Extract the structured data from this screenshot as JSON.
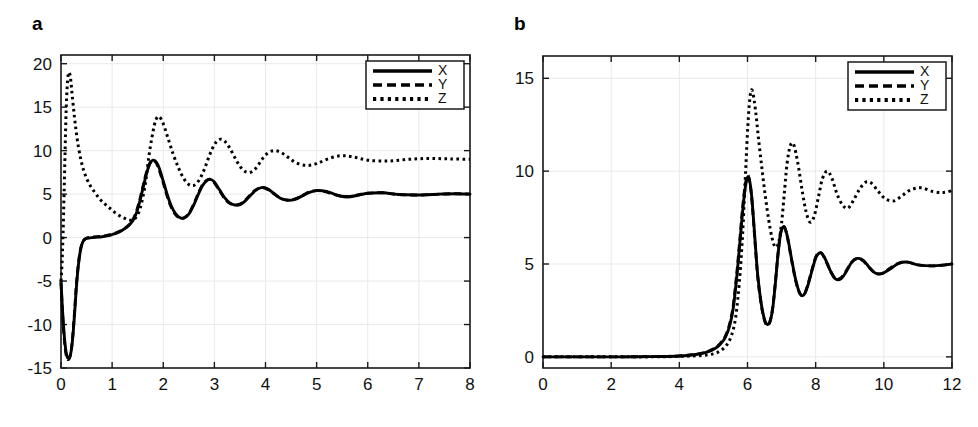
{
  "figure": {
    "background": "#ffffff",
    "ink_color": "#000000",
    "grid_color": "#e9e9e9"
  },
  "panels": [
    {
      "id": "a",
      "label": "a",
      "legend": {
        "position": "top-right",
        "entries": [
          {
            "name": "X",
            "style": "solid"
          },
          {
            "name": "Y",
            "style": "dashed"
          },
          {
            "name": "Z",
            "style": "dotted"
          }
        ]
      }
    },
    {
      "id": "b",
      "label": "b",
      "legend": {
        "position": "top-right",
        "entries": [
          {
            "name": "X",
            "style": "solid"
          },
          {
            "name": "Y",
            "style": "dashed"
          },
          {
            "name": "Z",
            "style": "dotted"
          }
        ]
      }
    }
  ],
  "chart_data": [
    {
      "type": "line",
      "panel": "a",
      "title": "a",
      "xlabel": "",
      "ylabel": "",
      "xlim": [
        0,
        8
      ],
      "ylim": [
        -15,
        21
      ],
      "xticks": [
        0,
        1,
        2,
        3,
        4,
        5,
        6,
        7,
        8
      ],
      "xticklabels": [
        "0",
        "1",
        "2",
        "3",
        "4",
        "5",
        "6",
        "7",
        "8"
      ],
      "yticks": [
        -15,
        -10,
        -5,
        0,
        5,
        10,
        15,
        20
      ],
      "yticklabels": [
        "-15",
        "-10",
        "-5",
        "0",
        "5",
        "10",
        "15",
        "20"
      ],
      "grid": true,
      "legend": [
        "X",
        "Y",
        "Z"
      ],
      "legend_position": "upper right",
      "series": [
        {
          "name": "X",
          "style": "solid",
          "x": [
            0.0,
            0.03,
            0.06,
            0.09,
            0.12,
            0.15,
            0.18,
            0.21,
            0.24,
            0.27,
            0.3,
            0.34,
            0.38,
            0.42,
            0.46,
            0.5,
            0.6,
            0.7,
            0.8,
            0.9,
            1.0,
            1.1,
            1.2,
            1.3,
            1.4,
            1.48,
            1.56,
            1.62,
            1.68,
            1.74,
            1.8,
            1.86,
            1.92,
            2.0,
            2.08,
            2.16,
            2.24,
            2.32,
            2.4,
            2.5,
            2.6,
            2.68,
            2.76,
            2.84,
            2.92,
            3.0,
            3.1,
            3.2,
            3.3,
            3.4,
            3.5,
            3.6,
            3.7,
            3.8,
            3.92,
            4.04,
            4.16,
            4.3,
            4.44,
            4.58,
            4.72,
            4.86,
            5.0,
            5.16,
            5.32,
            5.48,
            5.64,
            5.8,
            6.0,
            6.3,
            6.6,
            7.0,
            7.4,
            7.7,
            8.0
          ],
          "y": [
            -5.0,
            -8.4,
            -11.0,
            -12.8,
            -13.7,
            -13.9,
            -13.6,
            -12.6,
            -10.8,
            -8.4,
            -5.8,
            -3.2,
            -1.5,
            -0.6,
            -0.25,
            -0.1,
            0.0,
            0.05,
            0.1,
            0.2,
            0.35,
            0.55,
            0.85,
            1.25,
            1.9,
            2.9,
            4.6,
            6.1,
            7.5,
            8.5,
            8.9,
            8.7,
            8.0,
            6.5,
            4.9,
            3.6,
            2.75,
            2.3,
            2.25,
            2.7,
            3.8,
            4.9,
            5.9,
            6.5,
            6.7,
            6.4,
            5.5,
            4.6,
            4.0,
            3.75,
            3.8,
            4.2,
            4.8,
            5.4,
            5.75,
            5.6,
            5.1,
            4.5,
            4.3,
            4.4,
            4.8,
            5.2,
            5.4,
            5.35,
            5.05,
            4.75,
            4.7,
            4.85,
            5.1,
            5.15,
            4.95,
            4.9,
            5.0,
            5.05,
            5.0
          ]
        },
        {
          "name": "Y",
          "style": "dashed",
          "x": [
            0.0,
            0.03,
            0.06,
            0.09,
            0.12,
            0.15,
            0.18,
            0.21,
            0.24,
            0.27,
            0.3,
            0.34,
            0.38,
            0.42,
            0.46,
            0.5,
            0.6,
            0.7,
            0.8,
            0.9,
            1.0,
            1.1,
            1.2,
            1.3,
            1.4,
            1.48,
            1.56,
            1.62,
            1.68,
            1.74,
            1.8,
            1.86,
            1.92,
            2.0,
            2.08,
            2.16,
            2.24,
            2.32,
            2.4,
            2.5,
            2.6,
            2.68,
            2.76,
            2.84,
            2.92,
            3.0,
            3.1,
            3.2,
            3.3,
            3.4,
            3.5,
            3.6,
            3.7,
            3.8,
            3.92,
            4.04,
            4.16,
            4.3,
            4.44,
            4.58,
            4.72,
            4.86,
            5.0,
            5.16,
            5.32,
            5.48,
            5.64,
            5.8,
            6.0,
            6.3,
            6.6,
            7.0,
            7.4,
            7.7,
            8.0
          ],
          "y": [
            -5.2,
            -8.7,
            -11.4,
            -13.1,
            -13.9,
            -14.0,
            -13.6,
            -12.5,
            -10.6,
            -8.1,
            -5.5,
            -3.0,
            -1.4,
            -0.55,
            -0.2,
            -0.05,
            0.05,
            0.1,
            0.15,
            0.25,
            0.4,
            0.6,
            0.9,
            1.3,
            2.0,
            3.1,
            4.8,
            6.3,
            7.7,
            8.6,
            8.85,
            8.6,
            7.8,
            6.3,
            4.7,
            3.45,
            2.65,
            2.25,
            2.25,
            2.75,
            3.9,
            5.0,
            6.0,
            6.55,
            6.7,
            6.3,
            5.4,
            4.5,
            3.95,
            3.75,
            3.85,
            4.3,
            4.9,
            5.45,
            5.75,
            5.55,
            5.05,
            4.5,
            4.3,
            4.45,
            4.85,
            5.25,
            5.4,
            5.3,
            5.0,
            4.75,
            4.7,
            4.9,
            5.1,
            5.15,
            4.95,
            4.9,
            5.0,
            5.05,
            5.0
          ]
        },
        {
          "name": "Z",
          "style": "dotted",
          "x": [
            0.0,
            0.02,
            0.04,
            0.06,
            0.08,
            0.1,
            0.12,
            0.14,
            0.16,
            0.18,
            0.2,
            0.22,
            0.25,
            0.28,
            0.32,
            0.38,
            0.45,
            0.55,
            0.65,
            0.75,
            0.85,
            0.95,
            1.05,
            1.15,
            1.25,
            1.35,
            1.45,
            1.55,
            1.65,
            1.72,
            1.8,
            1.86,
            1.92,
            2.0,
            2.1,
            2.2,
            2.3,
            2.4,
            2.5,
            2.6,
            2.7,
            2.8,
            2.9,
            3.0,
            3.1,
            3.2,
            3.3,
            3.4,
            3.5,
            3.6,
            3.7,
            3.8,
            3.9,
            4.0,
            4.15,
            4.3,
            4.45,
            4.6,
            4.8,
            5.0,
            5.2,
            5.45,
            5.7,
            6.0,
            6.4,
            6.8,
            7.2,
            7.6,
            8.0
          ],
          "y": [
            -5.0,
            -3.0,
            0.5,
            5.0,
            10.0,
            14.5,
            17.3,
            18.7,
            19.0,
            18.6,
            17.6,
            16.3,
            14.6,
            13.0,
            11.2,
            9.2,
            7.6,
            6.2,
            5.3,
            4.5,
            3.9,
            3.4,
            2.9,
            2.5,
            2.2,
            2.0,
            2.2,
            3.4,
            6.2,
            9.4,
            12.2,
            13.6,
            13.9,
            13.1,
            11.3,
            9.5,
            8.0,
            6.8,
            6.1,
            6.0,
            6.6,
            7.8,
            9.4,
            10.7,
            11.3,
            11.1,
            10.3,
            9.2,
            8.2,
            7.6,
            7.5,
            7.9,
            8.7,
            9.5,
            10.0,
            9.8,
            9.2,
            8.6,
            8.3,
            8.5,
            9.0,
            9.4,
            9.3,
            8.9,
            8.8,
            9.0,
            9.1,
            9.05,
            9.0
          ]
        }
      ]
    },
    {
      "type": "line",
      "panel": "b",
      "title": "b",
      "xlabel": "",
      "ylabel": "",
      "xlim": [
        0,
        12
      ],
      "ylim": [
        -0.6,
        16.2
      ],
      "xticks": [
        0,
        2,
        4,
        6,
        8,
        10,
        12
      ],
      "xticklabels": [
        "0",
        "2",
        "4",
        "6",
        "8",
        "10",
        "12"
      ],
      "yticks": [
        0,
        5,
        10,
        15
      ],
      "yticklabels": [
        "0",
        "5",
        "10",
        "15"
      ],
      "grid": true,
      "legend": [
        "X",
        "Y",
        "Z"
      ],
      "legend_position": "upper right",
      "series": [
        {
          "name": "X",
          "style": "solid",
          "x": [
            0.0,
            0.6,
            1.2,
            1.8,
            2.4,
            3.0,
            3.5,
            4.0,
            4.3,
            4.6,
            4.85,
            5.05,
            5.2,
            5.35,
            5.48,
            5.58,
            5.68,
            5.76,
            5.84,
            5.9,
            5.96,
            6.02,
            6.08,
            6.14,
            6.22,
            6.3,
            6.4,
            6.5,
            6.58,
            6.66,
            6.74,
            6.82,
            6.9,
            6.98,
            7.08,
            7.18,
            7.3,
            7.42,
            7.54,
            7.66,
            7.78,
            7.9,
            8.02,
            8.16,
            8.3,
            8.44,
            8.58,
            8.74,
            8.9,
            9.06,
            9.22,
            9.4,
            9.58,
            9.76,
            9.96,
            10.2,
            10.45,
            10.7,
            11.0,
            11.4,
            11.8,
            12.0
          ],
          "y": [
            0.0,
            0.0,
            0.0,
            0.0,
            0.0,
            0.01,
            0.02,
            0.05,
            0.09,
            0.16,
            0.28,
            0.45,
            0.68,
            1.05,
            1.7,
            2.6,
            4.2,
            5.8,
            7.5,
            8.6,
            9.4,
            9.7,
            9.3,
            8.3,
            6.3,
            4.4,
            2.9,
            2.0,
            1.75,
            1.9,
            2.6,
            4.0,
            5.6,
            6.7,
            7.0,
            6.4,
            5.2,
            4.1,
            3.4,
            3.35,
            3.9,
            4.7,
            5.4,
            5.6,
            5.2,
            4.6,
            4.2,
            4.2,
            4.6,
            5.1,
            5.3,
            5.2,
            4.8,
            4.5,
            4.5,
            4.75,
            5.05,
            5.1,
            4.95,
            4.9,
            4.95,
            5.0
          ]
        },
        {
          "name": "Y",
          "style": "dashed",
          "x": [
            0.0,
            0.6,
            1.2,
            1.8,
            2.4,
            3.0,
            3.5,
            4.0,
            4.3,
            4.6,
            4.85,
            5.05,
            5.2,
            5.35,
            5.48,
            5.58,
            5.68,
            5.76,
            5.84,
            5.9,
            5.96,
            6.02,
            6.08,
            6.14,
            6.22,
            6.3,
            6.4,
            6.5,
            6.58,
            6.66,
            6.74,
            6.82,
            6.9,
            6.98,
            7.08,
            7.18,
            7.3,
            7.42,
            7.54,
            7.66,
            7.78,
            7.9,
            8.02,
            8.16,
            8.3,
            8.44,
            8.58,
            8.74,
            8.9,
            9.06,
            9.22,
            9.4,
            9.58,
            9.76,
            9.96,
            10.2,
            10.45,
            10.7,
            11.0,
            11.4,
            11.8,
            12.0
          ],
          "y": [
            0.0,
            0.0,
            0.0,
            0.0,
            0.0,
            0.01,
            0.02,
            0.05,
            0.1,
            0.17,
            0.3,
            0.48,
            0.72,
            1.12,
            1.8,
            2.75,
            4.4,
            6.0,
            7.7,
            8.8,
            9.5,
            9.75,
            9.25,
            8.2,
            6.2,
            4.3,
            2.85,
            1.95,
            1.7,
            1.9,
            2.65,
            4.05,
            5.65,
            6.75,
            7.0,
            6.35,
            5.15,
            4.05,
            3.4,
            3.35,
            3.95,
            4.75,
            5.45,
            5.6,
            5.15,
            4.6,
            4.2,
            4.25,
            4.65,
            5.1,
            5.3,
            5.15,
            4.8,
            4.5,
            4.5,
            4.8,
            5.05,
            5.1,
            4.95,
            4.9,
            4.95,
            5.0
          ]
        },
        {
          "name": "Z",
          "style": "dotted",
          "x": [
            0.0,
            0.8,
            1.6,
            2.4,
            3.2,
            3.9,
            4.4,
            4.8,
            5.1,
            5.35,
            5.52,
            5.65,
            5.76,
            5.85,
            5.92,
            5.98,
            6.04,
            6.1,
            6.16,
            6.24,
            6.32,
            6.42,
            6.52,
            6.62,
            6.72,
            6.82,
            6.92,
            7.0,
            7.08,
            7.16,
            7.26,
            7.36,
            7.48,
            7.6,
            7.72,
            7.84,
            7.96,
            8.08,
            8.2,
            8.34,
            8.48,
            8.62,
            8.78,
            8.94,
            9.1,
            9.28,
            9.46,
            9.64,
            9.84,
            10.05,
            10.3,
            10.55,
            10.8,
            11.1,
            11.45,
            11.75,
            12.0
          ],
          "y": [
            0.0,
            0.0,
            0.0,
            0.0,
            0.0,
            0.02,
            0.05,
            0.1,
            0.22,
            0.55,
            1.1,
            2.1,
            4.0,
            6.4,
            9.0,
            11.4,
            13.3,
            14.3,
            14.2,
            13.2,
            11.8,
            10.2,
            8.7,
            7.4,
            6.4,
            5.9,
            6.2,
            7.2,
            8.8,
            10.4,
            11.4,
            11.4,
            10.4,
            9.0,
            7.8,
            7.25,
            7.6,
            8.6,
            9.6,
            10.0,
            9.6,
            8.8,
            8.2,
            8.0,
            8.4,
            9.0,
            9.4,
            9.35,
            8.9,
            8.5,
            8.4,
            8.7,
            9.0,
            9.1,
            8.9,
            8.85,
            8.95
          ]
        }
      ]
    }
  ]
}
